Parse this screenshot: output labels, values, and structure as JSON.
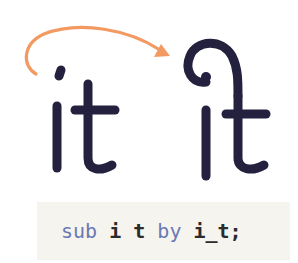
{
  "figure": {
    "source_glyphs": "it",
    "ligature_glyph": "i_t",
    "arrow_color": "#f39a62",
    "glyph_color": "#24213f"
  },
  "code": {
    "tokens": [
      {
        "text": "sub",
        "kind": "keyword"
      },
      {
        "text": " ",
        "kind": "space"
      },
      {
        "text": "i",
        "kind": "identifier"
      },
      {
        "text": " ",
        "kind": "space"
      },
      {
        "text": "t",
        "kind": "identifier"
      },
      {
        "text": " ",
        "kind": "space"
      },
      {
        "text": "by",
        "kind": "keyword"
      },
      {
        "text": " ",
        "kind": "space"
      },
      {
        "text": "i_t;",
        "kind": "identifier"
      }
    ],
    "full_text": "sub i t by i_t;",
    "keyword_color": "#6a79b3",
    "background": "#f6f4ef"
  }
}
